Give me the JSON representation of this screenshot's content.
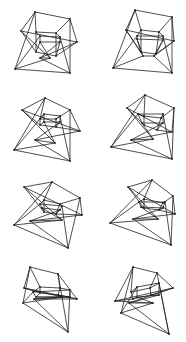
{
  "figures": [
    {
      "id": 1,
      "x": 0,
      "y": 0,
      "outer": [
        [
          35,
          12
        ],
        [
          70,
          19
        ],
        [
          21,
          31
        ],
        [
          77,
          42
        ],
        [
          15,
          69
        ],
        [
          70,
          73
        ],
        [
          50,
          58
        ],
        [
          40,
          58
        ]
      ],
      "inner": [
        [
          36,
          32
        ],
        [
          56,
          33
        ],
        [
          36,
          52
        ],
        [
          56,
          56
        ],
        [
          40,
          36
        ],
        [
          60,
          37
        ],
        [
          40,
          42
        ],
        [
          60,
          42
        ]
      ]
    },
    {
      "id": 2,
      "x": 93,
      "y": 0,
      "outer": [
        [
          42,
          10
        ],
        [
          79,
          17
        ],
        [
          33,
          30
        ],
        [
          81,
          41
        ],
        [
          20,
          68
        ],
        [
          79,
          73
        ],
        [
          50,
          56
        ],
        [
          61,
          56
        ]
      ],
      "inner": [
        [
          48,
          30
        ],
        [
          66,
          32
        ],
        [
          48,
          52
        ],
        [
          63,
          54
        ],
        [
          44,
          36
        ],
        [
          70,
          36
        ],
        [
          44,
          39
        ],
        [
          70,
          40
        ]
      ]
    },
    {
      "id": 3,
      "x": 0,
      "y": 85,
      "outer": [
        [
          45,
          13
        ],
        [
          70,
          25
        ],
        [
          22,
          25
        ],
        [
          80,
          46
        ],
        [
          14,
          65
        ],
        [
          70,
          76
        ],
        [
          55,
          58
        ],
        [
          35,
          55
        ]
      ],
      "inner": [
        [
          40,
          34
        ],
        [
          56,
          34
        ],
        [
          40,
          40
        ],
        [
          56,
          42
        ],
        [
          44,
          29
        ],
        [
          60,
          31
        ],
        [
          44,
          37
        ],
        [
          60,
          37
        ]
      ]
    },
    {
      "id": 4,
      "x": 93,
      "y": 85,
      "outer": [
        [
          52,
          10
        ],
        [
          81,
          23
        ],
        [
          34,
          23
        ],
        [
          79,
          47
        ],
        [
          18,
          62
        ],
        [
          79,
          74
        ],
        [
          60,
          54
        ],
        [
          38,
          55
        ]
      ],
      "inner": [
        [
          51,
          31
        ],
        [
          68,
          33
        ],
        [
          51,
          40
        ],
        [
          64,
          45
        ],
        [
          45,
          29
        ],
        [
          70,
          29
        ],
        [
          49,
          38
        ],
        [
          70,
          38
        ]
      ]
    },
    {
      "id": 5,
      "x": 0,
      "y": 170,
      "outer": [
        [
          52,
          12
        ],
        [
          80,
          28
        ],
        [
          24,
          17
        ],
        [
          82,
          45
        ],
        [
          14,
          55
        ],
        [
          68,
          78
        ],
        [
          62,
          50
        ],
        [
          30,
          51
        ]
      ],
      "inner": [
        [
          44,
          30
        ],
        [
          60,
          34
        ],
        [
          44,
          42
        ],
        [
          56,
          44
        ],
        [
          40,
          34
        ],
        [
          62,
          36
        ],
        [
          42,
          38
        ],
        [
          60,
          40
        ]
      ]
    },
    {
      "id": 6,
      "x": 93,
      "y": 170,
      "outer": [
        [
          59,
          10
        ],
        [
          80,
          26
        ],
        [
          35,
          17
        ],
        [
          82,
          44
        ],
        [
          17,
          53
        ],
        [
          78,
          75
        ],
        [
          65,
          49
        ],
        [
          40,
          49
        ]
      ],
      "inner": [
        [
          51,
          29
        ],
        [
          70,
          33
        ],
        [
          51,
          38
        ],
        [
          66,
          40
        ],
        [
          46,
          32
        ],
        [
          72,
          32
        ],
        [
          48,
          37
        ],
        [
          70,
          38
        ]
      ]
    },
    {
      "id": 7,
      "x": 0,
      "y": 255,
      "outer": [
        [
          30,
          12
        ],
        [
          58,
          19
        ],
        [
          24,
          33
        ],
        [
          77,
          44
        ],
        [
          23,
          48
        ],
        [
          68,
          77
        ],
        [
          62,
          42
        ],
        [
          34,
          44
        ]
      ],
      "inner": [
        [
          40,
          32
        ],
        [
          60,
          33
        ],
        [
          40,
          38
        ],
        [
          58,
          40
        ],
        [
          33,
          37
        ],
        [
          70,
          35
        ],
        [
          36,
          42
        ],
        [
          70,
          42
        ]
      ]
    },
    {
      "id": 8,
      "x": 93,
      "y": 255,
      "outer": [
        [
          40,
          12
        ],
        [
          64,
          18
        ],
        [
          22,
          46
        ],
        [
          80,
          33
        ],
        [
          28,
          58
        ],
        [
          76,
          79
        ],
        [
          60,
          48
        ],
        [
          36,
          48
        ]
      ],
      "inner": [
        [
          38,
          37
        ],
        [
          57,
          33
        ],
        [
          40,
          44
        ],
        [
          58,
          40
        ],
        [
          44,
          32
        ],
        [
          66,
          28
        ],
        [
          44,
          42
        ],
        [
          66,
          40
        ]
      ]
    }
  ]
}
